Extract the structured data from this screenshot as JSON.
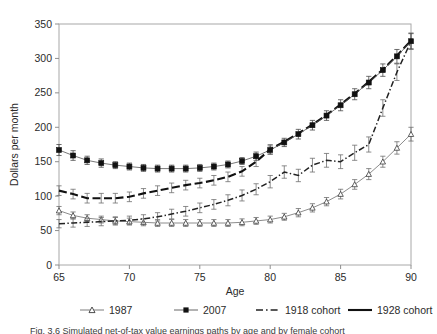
{
  "figure": {
    "caption": "Fig. 3.6   Simulated net-of-tax value earnings paths by age and by female cohort"
  },
  "axes": {
    "xlabel": "Age",
    "ylabel": "Dollars  per month",
    "x_ticks": [
      "65",
      "70",
      "75",
      "80",
      "85",
      "90"
    ],
    "y_ticks": [
      "0",
      "50",
      "100",
      "150",
      "200",
      "250",
      "300",
      "350"
    ]
  },
  "legend": {
    "items": [
      {
        "label": "1987",
        "marker": "open-triangle-marker",
        "line": "thin-solid"
      },
      {
        "label": "2007",
        "marker": "filled-square-marker",
        "line": "thin-solid"
      },
      {
        "label": "1918 cohort",
        "marker": "dash-dot-line-swatch",
        "line": "dash-dot"
      },
      {
        "label": "1928 cohort",
        "marker": "solid-line-swatch",
        "line": "thick-dash"
      }
    ]
  },
  "chart_data": {
    "type": "line",
    "title": "",
    "xlabel": "Age",
    "ylabel": "Dollars per month",
    "xlim": [
      65,
      90
    ],
    "ylim": [
      0,
      350
    ],
    "x": [
      65,
      66,
      67,
      68,
      69,
      70,
      71,
      72,
      73,
      74,
      75,
      76,
      77,
      78,
      79,
      80,
      81,
      82,
      83,
      84,
      85,
      86,
      87,
      88,
      89,
      90
    ],
    "grid": false,
    "legend_position": "below-axes",
    "error_bars": true,
    "series": [
      {
        "name": "1987",
        "style": "thin solid line with open triangle markers",
        "color": "#555555",
        "values": [
          79,
          72,
          68,
          66,
          64,
          63,
          62,
          61,
          61,
          61,
          61,
          61,
          61,
          62,
          64,
          66,
          70,
          76,
          83,
          92,
          103,
          117,
          132,
          150,
          170,
          190
        ],
        "errors": [
          6,
          5,
          5,
          5,
          5,
          5,
          5,
          5,
          5,
          5,
          5,
          5,
          5,
          5,
          5,
          5,
          5,
          6,
          6,
          6,
          7,
          7,
          8,
          8,
          9,
          10
        ]
      },
      {
        "name": "2007",
        "style": "thin solid line with filled square markers",
        "color": "#111111",
        "values": [
          167,
          159,
          152,
          148,
          145,
          143,
          141,
          140,
          140,
          140,
          141,
          143,
          146,
          151,
          158,
          167,
          178,
          190,
          203,
          217,
          232,
          248,
          265,
          283,
          303,
          325
        ],
        "errors": [
          8,
          7,
          6,
          6,
          5,
          5,
          5,
          5,
          5,
          5,
          5,
          5,
          5,
          5,
          6,
          6,
          6,
          7,
          7,
          7,
          8,
          8,
          9,
          9,
          10,
          11
        ]
      },
      {
        "name": "1918 cohort",
        "style": "dash-dot line with short tick markers",
        "color": "#333333",
        "values": [
          60,
          61,
          62,
          63,
          64,
          65,
          67,
          70,
          74,
          78,
          83,
          88,
          94,
          101,
          110,
          121,
          135,
          130,
          145,
          152,
          150,
          163,
          175,
          228,
          280,
          325
        ],
        "errors": [
          6,
          6,
          6,
          6,
          6,
          6,
          6,
          6,
          7,
          7,
          7,
          7,
          8,
          8,
          8,
          9,
          9,
          9,
          10,
          10,
          10,
          11,
          11,
          12,
          12,
          12
        ]
      },
      {
        "name": "1928 cohort",
        "style": "thick dashed line",
        "color": "#1a1a1a",
        "values": [
          108,
          103,
          97,
          97,
          97,
          99,
          104,
          108,
          112,
          116,
          119,
          123,
          128,
          136,
          150,
          168,
          179,
          191,
          204,
          218,
          233,
          249,
          266,
          284,
          304,
          326
        ],
        "errors": [
          7,
          7,
          7,
          7,
          7,
          7,
          7,
          7,
          7,
          7,
          7,
          7,
          7,
          7,
          7,
          7,
          0,
          0,
          0,
          0,
          0,
          0,
          0,
          0,
          0,
          0
        ]
      }
    ]
  }
}
